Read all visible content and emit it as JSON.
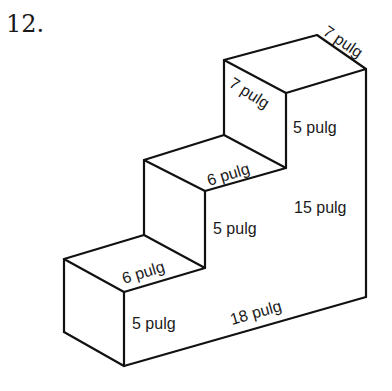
{
  "problem_number": "12.",
  "figure": {
    "type": "staircase-prism",
    "labels": {
      "top_back_width": "7 pulg",
      "top_left_depth": "7 pulg",
      "top_step_height": "5 pulg",
      "middle_step_depth": "6 pulg",
      "middle_step_height": "5 pulg",
      "total_height": "15 pulg",
      "bottom_step_depth": "6 pulg",
      "bottom_step_height": "5 pulg",
      "total_length": "18 pulg"
    }
  }
}
